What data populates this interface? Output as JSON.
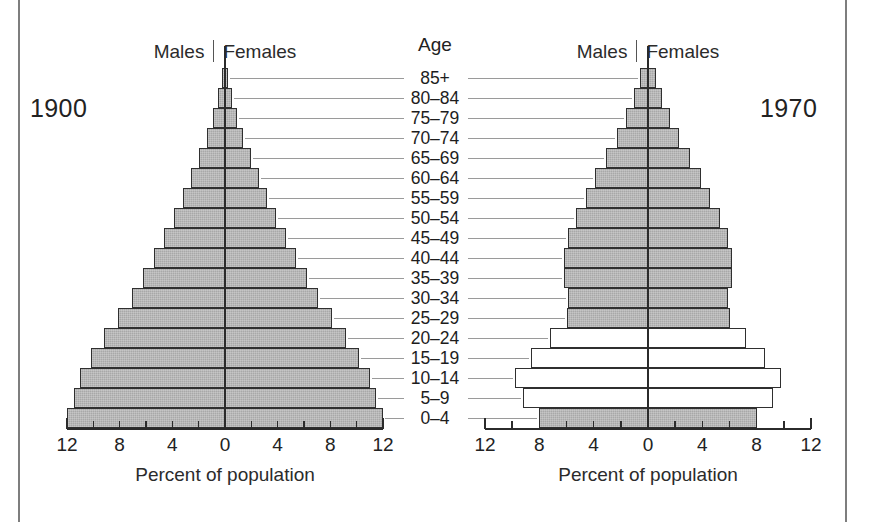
{
  "figure": {
    "age_column_title": "Age",
    "axis_title": "Percent of population",
    "sex_left_label": "Males",
    "sex_right_label": "Females",
    "age_groups": [
      "85+",
      "80–84",
      "75–79",
      "70–74",
      "65–69",
      "60–64",
      "55–59",
      "50–54",
      "45–49",
      "40–44",
      "35–39",
      "30–34",
      "25–29",
      "20–24",
      "15–19",
      "10–14",
      "5–9",
      "0–4"
    ],
    "tick_labels": [
      "12",
      "8",
      "4",
      "0",
      "4",
      "8",
      "12"
    ],
    "tick_values": [
      -12,
      -8,
      -4,
      0,
      4,
      8,
      12
    ],
    "colors": {
      "bar_fill": "#a8a8a8",
      "bar_hollow": "#ffffff",
      "bar_outline": "#2f2f2f",
      "text": "#222222",
      "leader_line": "#9a9a9a",
      "frame_rule": "#7e7e7e"
    }
  },
  "chart_data": [
    {
      "type": "bar",
      "title": "1900",
      "subtitle": "Population pyramid, United States, 1900",
      "xlabel": "Percent of population",
      "ylabel": "Age",
      "xlim": [
        -12,
        12
      ],
      "grid": false,
      "legend": [
        "Males",
        "Females"
      ],
      "orientation": "horizontal-diverging",
      "categories": [
        "85+",
        "80–84",
        "75–79",
        "70–74",
        "65–69",
        "60–64",
        "55–59",
        "50–54",
        "45–49",
        "40–44",
        "35–39",
        "30–34",
        "25–29",
        "20–24",
        "15–19",
        "10–14",
        "5–9",
        "0–4"
      ],
      "series": [
        {
          "name": "Males",
          "values": [
            0.2,
            0.5,
            0.9,
            1.4,
            2.0,
            2.6,
            3.2,
            3.9,
            4.6,
            5.4,
            6.2,
            7.1,
            8.1,
            9.2,
            10.2,
            11.0,
            11.5,
            12.0
          ]
        },
        {
          "name": "Females",
          "values": [
            0.2,
            0.5,
            0.9,
            1.4,
            2.0,
            2.6,
            3.2,
            3.9,
            4.6,
            5.4,
            6.2,
            7.1,
            8.1,
            9.2,
            10.2,
            11.0,
            11.5,
            12.0
          ]
        }
      ],
      "bar_styles": [
        "filled",
        "filled",
        "filled",
        "filled",
        "filled",
        "filled",
        "filled",
        "filled",
        "filled",
        "filled",
        "filled",
        "filled",
        "filled",
        "filled",
        "filled",
        "filled",
        "filled",
        "filled"
      ]
    },
    {
      "type": "bar",
      "title": "1970",
      "subtitle": "Population pyramid, United States, 1970",
      "xlabel": "Percent of population",
      "ylabel": "Age",
      "xlim": [
        -12,
        12
      ],
      "grid": false,
      "legend": [
        "Males",
        "Females"
      ],
      "orientation": "horizontal-diverging",
      "categories": [
        "85+",
        "80–84",
        "75–79",
        "70–74",
        "65–69",
        "60–64",
        "55–59",
        "50–54",
        "45–49",
        "40–44",
        "35–39",
        "30–34",
        "25–29",
        "20–24",
        "15–19",
        "10–14",
        "5–9",
        "0–4"
      ],
      "series": [
        {
          "name": "Males",
          "values": [
            0.6,
            1.0,
            1.6,
            2.3,
            3.1,
            3.9,
            4.6,
            5.3,
            5.9,
            6.2,
            6.2,
            5.9,
            6.0,
            7.2,
            8.6,
            9.8,
            9.2,
            8.0
          ]
        },
        {
          "name": "Females",
          "values": [
            0.6,
            1.0,
            1.6,
            2.3,
            3.1,
            3.9,
            4.6,
            5.3,
            5.9,
            6.2,
            6.2,
            5.9,
            6.0,
            7.2,
            8.6,
            9.8,
            9.2,
            8.0
          ]
        }
      ],
      "bar_styles": [
        "filled",
        "filled",
        "filled",
        "filled",
        "filled",
        "filled",
        "filled",
        "filled",
        "filled",
        "filled",
        "filled",
        "filled",
        "filled",
        "hollow",
        "hollow",
        "hollow",
        "hollow",
        "filled"
      ]
    }
  ]
}
